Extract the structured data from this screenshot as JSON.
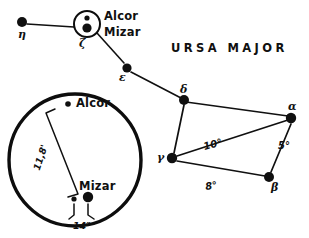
{
  "figure": {
    "title": "URSA MAJOR",
    "background_color": "#ffffff",
    "ink_color": "#101010"
  },
  "constellation": {
    "stars": [
      {
        "id": "eta",
        "label": "η",
        "x": 22,
        "y": 22,
        "r": 5.0
      },
      {
        "id": "zeta",
        "label": "ζ",
        "x": 87,
        "y": 24,
        "r": 0.0
      },
      {
        "id": "epsilon",
        "label": "ε",
        "x": 127,
        "y": 68,
        "r": 4.6
      },
      {
        "id": "delta",
        "label": "δ",
        "x": 184,
        "y": 100,
        "r": 5.0
      },
      {
        "id": "gamma",
        "label": "γ",
        "x": 172,
        "y": 158,
        "r": 5.2
      },
      {
        "id": "beta",
        "label": "β",
        "x": 269,
        "y": 177,
        "r": 5.0
      },
      {
        "id": "alpha",
        "label": "α",
        "x": 291,
        "y": 118,
        "r": 5.2
      }
    ],
    "handle_links": [
      {
        "from": "eta",
        "to": "zeta"
      },
      {
        "from": "zeta",
        "to": "epsilon"
      },
      {
        "from": "epsilon",
        "to": "delta"
      }
    ],
    "bowl_links": [
      {
        "from": "delta",
        "to": "alpha"
      },
      {
        "from": "delta",
        "to": "gamma"
      },
      {
        "from": "gamma",
        "to": "alpha",
        "angle_label": "10°"
      },
      {
        "from": "gamma",
        "to": "beta",
        "angle_label": "8°"
      },
      {
        "from": "beta",
        "to": "alpha",
        "angle_label": "5°"
      }
    ],
    "angles": {
      "gamma_alpha": "10°",
      "gamma_beta": "8°",
      "beta_alpha": "5°"
    }
  },
  "zeta_inset": {
    "label_zeta": "ζ",
    "label_alcor": "Alcor",
    "label_mizar": "Mizar",
    "circle": {
      "cx": 87,
      "cy": 24,
      "r": 13
    },
    "alcor_dot": {
      "cx": 87,
      "cy": 18,
      "r": 2.6
    },
    "mizar_dot": {
      "cx": 87,
      "cy": 28,
      "r": 4.6
    }
  },
  "magnified_inset": {
    "label_alcor": "Alcor",
    "label_mizar": "Mizar",
    "separation_alcor_mizar": "11,8'",
    "separation_mizar_pair": "14″",
    "circle": {
      "cx": 75,
      "cy": 160,
      "r": 66
    },
    "alcor_dot": {
      "cx": 68,
      "cy": 104,
      "r": 2.8
    },
    "mizar_primary_dot": {
      "cx": 88,
      "cy": 197,
      "r": 5.2
    },
    "mizar_companion_dot": {
      "cx": 74,
      "cy": 199,
      "r": 2.6
    }
  }
}
